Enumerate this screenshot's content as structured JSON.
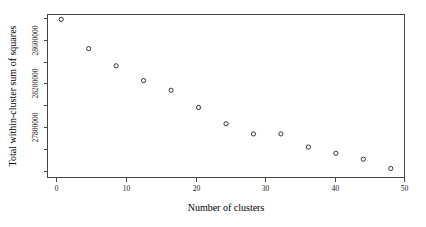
{
  "chart_data": {
    "type": "scatter",
    "title": "",
    "xlabel": "Number of clusters",
    "ylabel": "Total within-cluster sum of squares",
    "x": [
      2,
      6,
      10,
      14,
      18,
      22,
      26,
      30,
      34,
      38,
      42,
      46,
      50
    ],
    "values": [
      28678000,
      28545000,
      28467000,
      28400000,
      28356000,
      28278000,
      28204000,
      28158000,
      28158000,
      28098000,
      28070000,
      28043000,
      28001000
    ],
    "xlim": [
      0,
      52
    ],
    "ylim": [
      27960000,
      28700000
    ],
    "xticks": [
      0,
      10,
      20,
      30,
      40,
      50
    ],
    "xtick_labels": [
      "0",
      "10",
      "20",
      "30",
      "40",
      "50"
    ],
    "yticks": [
      28600000,
      28200000,
      27800000
    ],
    "ytick_labels": [
      "28600000",
      "28200000",
      "27800000"
    ],
    "ytick_minor_count": 7,
    "grid": false,
    "legend": false,
    "marker": "open-circle",
    "marker_color": "#333333",
    "axis_color": "#444444",
    "background": "#ffffff"
  },
  "axes": {
    "x_title": "Number of clusters",
    "y_title": "Total within-cluster sum of squares"
  },
  "x_tick_labels": [
    "0",
    "10",
    "20",
    "30",
    "40",
    "50"
  ],
  "y_tick_labels": [
    "28600000",
    "28200000",
    "27800000"
  ]
}
